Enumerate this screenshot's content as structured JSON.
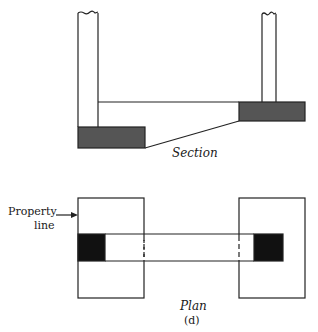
{
  "figure": {
    "section_label": "Section",
    "plan_label": "Plan",
    "figure_tag": "(d)",
    "annotation": {
      "line1": "Property",
      "line2": "line"
    }
  },
  "colors": {
    "footing_section": "#555555",
    "footing_plan": "#111111",
    "stroke": "#222222"
  },
  "elements": {
    "section": [
      "left-wall",
      "right-wall",
      "grade-beam",
      "left-footing",
      "right-footing"
    ],
    "plan": [
      "left-footing-outline",
      "right-footing-outline",
      "grade-beam-plan",
      "left-column",
      "right-column"
    ]
  }
}
